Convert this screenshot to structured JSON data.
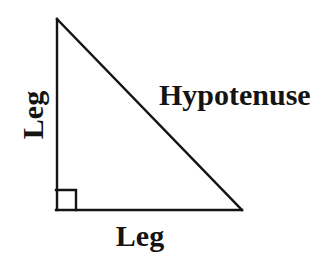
{
  "figure": {
    "background_color": "#ffffff",
    "stroke_color": "#141414",
    "text_color": "#141414",
    "width": 332,
    "height": 265
  },
  "labels": {
    "hypotenuse": "Hypotenuse",
    "leg_vertical": "Leg",
    "leg_horizontal": "Leg"
  },
  "shape": {
    "name": "right-triangle",
    "vertices": {
      "apex": {
        "x": 56,
        "y": 19
      },
      "bottom_left": {
        "x": 56,
        "y": 210
      },
      "bottom_right": {
        "x": 242,
        "y": 210
      }
    },
    "stroke_width": 2.4,
    "right_angle_marker": {
      "name": "right-angle-square",
      "corner": {
        "x": 56,
        "y": 210
      },
      "size": 20
    },
    "sides": [
      {
        "name": "vertical-leg",
        "label": "Leg",
        "from": "bottom_left",
        "to": "apex"
      },
      {
        "name": "horizontal-leg",
        "label": "Leg",
        "from": "bottom_left",
        "to": "bottom_right"
      },
      {
        "name": "hypotenuse",
        "label": "Hypotenuse",
        "from": "apex",
        "to": "bottom_right"
      }
    ]
  }
}
